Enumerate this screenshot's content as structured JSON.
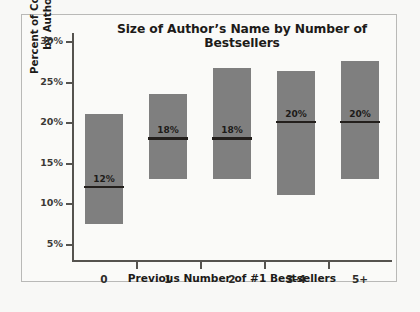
{
  "chart_data": {
    "type": "bar",
    "title": "Size of Author’s Name by Number of Bestsellers",
    "xlabel": "Previous Number of #1 Bestsellers",
    "ylabel_line1": "Percent of Cover Taken Up",
    "ylabel_line2": "by Author’s Name",
    "categories": [
      "0",
      "1",
      "2",
      "3–4",
      "5+"
    ],
    "ytick_labels": [
      "30%",
      "25%",
      "20%",
      "15%",
      "10%",
      "5%"
    ],
    "ytick_values": [
      30,
      25,
      20,
      15,
      10,
      5
    ],
    "ylim": [
      3.0,
      31.0
    ],
    "grid": false,
    "legend": false,
    "bar_color": "#7f7f7f",
    "median_color": "#231f1c",
    "axis_color": "#55534f",
    "background_color": "#fafaf8",
    "frame_color": "#b9b9b7",
    "series": [
      {
        "name": "Range of cover percentage",
        "bar_bottoms": [
          7.5,
          13.0,
          13.0,
          11.0,
          13.0
        ],
        "bar_tops": [
          21.0,
          23.5,
          26.7,
          26.3,
          27.5
        ]
      },
      {
        "name": "Median",
        "values": [
          12,
          18,
          18,
          20,
          20
        ],
        "labels": [
          "12%",
          "18%",
          "18%",
          "20%",
          "20%"
        ]
      }
    ]
  }
}
